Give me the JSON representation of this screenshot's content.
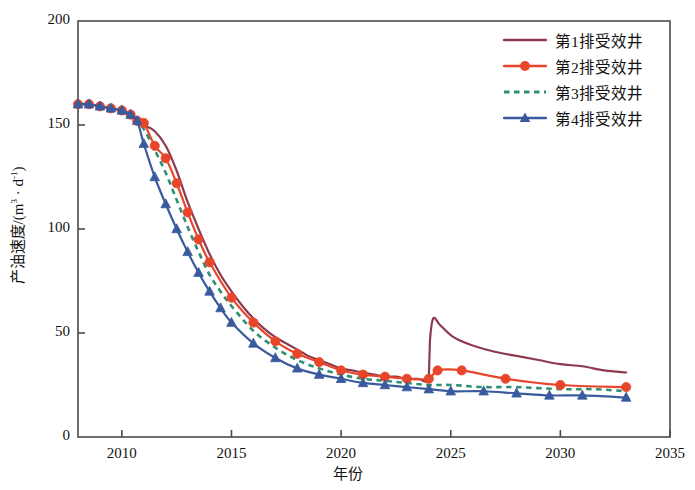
{
  "chart_data": {
    "type": "line",
    "title": "",
    "xlabel": "年份",
    "ylabel": "产油速度/(m³ · d⁻¹)",
    "xlim": [
      2008,
      2035
    ],
    "ylim": [
      0,
      200
    ],
    "xticks": [
      2010,
      2015,
      2020,
      2025,
      2030,
      2035
    ],
    "yticks": [
      0,
      50,
      100,
      150,
      200
    ],
    "grid": false,
    "legend_position": "top-right",
    "series": [
      {
        "name": "第1排受效井",
        "color": "#8e3a4e",
        "style": "solid",
        "marker": "none",
        "x": [
          2008.0,
          2008.5,
          2009.0,
          2009.5,
          2010.0,
          2010.4,
          2010.7,
          2011.0,
          2011.5,
          2012.0,
          2012.5,
          2013.0,
          2013.5,
          2014.0,
          2014.5,
          2015.0,
          2015.5,
          2016.0,
          2016.5,
          2017.0,
          2017.5,
          2018.0,
          2018.5,
          2019.0,
          2019.5,
          2020.0,
          2020.5,
          2021.0,
          2021.5,
          2022.0,
          2022.5,
          2023.0,
          2023.5,
          2024.0,
          2024.05,
          2024.2,
          2024.5,
          2025.0,
          2025.5,
          2026.0,
          2027.0,
          2028.0,
          2029.0,
          2030.0,
          2031.0,
          2032.0,
          2033.0
        ],
        "y": [
          160,
          160,
          159,
          158,
          157,
          155,
          152,
          150,
          147,
          140,
          128,
          113,
          100,
          88,
          78,
          70,
          63,
          57,
          52,
          48,
          45,
          42,
          39,
          37,
          35,
          33,
          32,
          31,
          30,
          29,
          29,
          28,
          28,
          28,
          46,
          57,
          54,
          49,
          46,
          44,
          41,
          39,
          37,
          35,
          34,
          32,
          31
        ]
      },
      {
        "name": "第2排受效井",
        "color": "#e8452a",
        "style": "solid",
        "marker": "circle",
        "x": [
          2008.0,
          2008.5,
          2009.0,
          2009.5,
          2010.0,
          2010.4,
          2010.7,
          2011.0,
          2011.5,
          2012.0,
          2012.5,
          2013.0,
          2013.5,
          2014.0,
          2015.0,
          2016.0,
          2017.0,
          2018.0,
          2019.0,
          2020.0,
          2021.0,
          2022.0,
          2023.0,
          2024.0,
          2024.4,
          2025.5,
          2027.5,
          2030.0,
          2033.0
        ],
        "y": [
          160,
          160,
          159,
          158,
          157,
          155,
          152,
          151,
          140,
          134,
          122,
          108,
          95,
          84,
          67,
          55,
          46,
          40,
          36,
          32,
          30,
          29,
          28,
          28,
          32,
          32,
          28,
          25,
          24
        ]
      },
      {
        "name": "第3排受效井",
        "color": "#2f8f73",
        "style": "dashed",
        "marker": "none",
        "x": [
          2008.0,
          2008.5,
          2009.0,
          2009.5,
          2010.0,
          2010.4,
          2010.7,
          2011.0,
          2011.5,
          2012.0,
          2012.5,
          2013.0,
          2013.5,
          2014.0,
          2014.5,
          2015.0,
          2016.0,
          2017.0,
          2018.0,
          2019.0,
          2020.0,
          2021.0,
          2022.0,
          2023.0,
          2024.0,
          2025.0,
          2026.5,
          2028.0,
          2030.0,
          2031.5,
          2033.0
        ],
        "y": [
          160,
          160,
          159,
          158,
          157,
          155,
          152,
          148,
          138,
          127,
          114,
          101,
          89,
          78,
          70,
          63,
          51,
          43,
          37,
          33,
          30,
          28,
          27,
          26,
          25,
          25,
          24,
          24,
          23,
          23,
          22
        ]
      },
      {
        "name": "第4排受效井",
        "color": "#3a5a9e",
        "style": "solid",
        "marker": "triangle",
        "x": [
          2008.0,
          2008.5,
          2009.0,
          2009.5,
          2010.0,
          2010.4,
          2010.7,
          2011.0,
          2011.5,
          2012.0,
          2012.5,
          2013.0,
          2013.5,
          2014.0,
          2014.5,
          2015.0,
          2016.0,
          2017.0,
          2018.0,
          2019.0,
          2020.0,
          2021.0,
          2022.0,
          2023.0,
          2024.0,
          2025.0,
          2026.5,
          2028.0,
          2029.5,
          2031.0,
          2033.0
        ],
        "y": [
          160,
          160,
          159,
          158,
          157,
          155,
          152,
          141,
          125,
          112,
          100,
          89,
          79,
          70,
          62,
          55,
          45,
          38,
          33,
          30,
          28,
          26,
          25,
          24,
          23,
          22,
          22,
          21,
          20,
          20,
          19
        ]
      }
    ],
    "annotations": [
      {
        "text": "第1排受效井 production rebound spike",
        "x": 2024.2,
        "y": 57
      }
    ]
  }
}
